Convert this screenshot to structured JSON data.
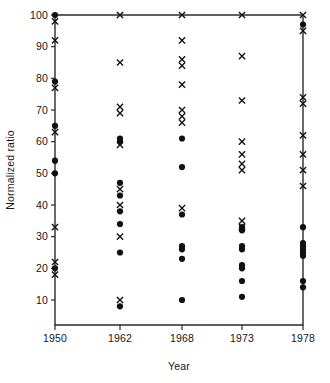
{
  "chart_data": {
    "type": "scatter",
    "title": "",
    "xlabel": "Year",
    "ylabel": "Normalized ratio",
    "grid": false,
    "legend": "none",
    "categories": [
      "1950",
      "1962",
      "1968",
      "1973",
      "1978"
    ],
    "xtick_labels": [
      "1950",
      "1962",
      "1968",
      "1973",
      "1978"
    ],
    "ytick_labels": [
      "10",
      "20",
      "30",
      "40",
      "50",
      "60",
      "70",
      "80",
      "90",
      "100"
    ],
    "ylim": [
      0,
      100
    ],
    "ytick_values": [
      10,
      20,
      30,
      40,
      50,
      60,
      70,
      80,
      90,
      100
    ],
    "marker_types": [
      "filled-circle",
      "cross"
    ],
    "series": [
      {
        "name": "filled-circle",
        "marker": "filled-circle",
        "points": [
          {
            "x": "1950",
            "y": 100
          },
          {
            "x": "1950",
            "y": 79
          },
          {
            "x": "1950",
            "y": 65
          },
          {
            "x": "1950",
            "y": 54
          },
          {
            "x": "1950",
            "y": 50
          },
          {
            "x": "1950",
            "y": 20
          },
          {
            "x": "1962",
            "y": 61
          },
          {
            "x": "1962",
            "y": 60
          },
          {
            "x": "1962",
            "y": 47
          },
          {
            "x": "1962",
            "y": 43
          },
          {
            "x": "1962",
            "y": 38
          },
          {
            "x": "1962",
            "y": 34
          },
          {
            "x": "1962",
            "y": 25
          },
          {
            "x": "1962",
            "y": 8
          },
          {
            "x": "1968",
            "y": 61
          },
          {
            "x": "1968",
            "y": 52
          },
          {
            "x": "1968",
            "y": 37
          },
          {
            "x": "1968",
            "y": 27
          },
          {
            "x": "1968",
            "y": 26
          },
          {
            "x": "1968",
            "y": 23
          },
          {
            "x": "1968",
            "y": 10
          },
          {
            "x": "1973",
            "y": 33
          },
          {
            "x": "1973",
            "y": 32
          },
          {
            "x": "1973",
            "y": 27
          },
          {
            "x": "1973",
            "y": 26
          },
          {
            "x": "1973",
            "y": 21
          },
          {
            "x": "1973",
            "y": 20
          },
          {
            "x": "1973",
            "y": 16
          },
          {
            "x": "1973",
            "y": 11
          },
          {
            "x": "1978",
            "y": 97
          },
          {
            "x": "1978",
            "y": 33
          },
          {
            "x": "1978",
            "y": 28
          },
          {
            "x": "1978",
            "y": 27
          },
          {
            "x": "1978",
            "y": 26
          },
          {
            "x": "1978",
            "y": 25
          },
          {
            "x": "1978",
            "y": 24
          },
          {
            "x": "1978",
            "y": 16
          },
          {
            "x": "1978",
            "y": 14
          }
        ]
      },
      {
        "name": "cross",
        "marker": "cross",
        "points": [
          {
            "x": "1950",
            "y": 98
          },
          {
            "x": "1950",
            "y": 92
          },
          {
            "x": "1950",
            "y": 77
          },
          {
            "x": "1950",
            "y": 63
          },
          {
            "x": "1950",
            "y": 33
          },
          {
            "x": "1950",
            "y": 22
          },
          {
            "x": "1950",
            "y": 18
          },
          {
            "x": "1962",
            "y": 100
          },
          {
            "x": "1962",
            "y": 85
          },
          {
            "x": "1962",
            "y": 71
          },
          {
            "x": "1962",
            "y": 69
          },
          {
            "x": "1962",
            "y": 59
          },
          {
            "x": "1962",
            "y": 45
          },
          {
            "x": "1962",
            "y": 40
          },
          {
            "x": "1962",
            "y": 30
          },
          {
            "x": "1962",
            "y": 10
          },
          {
            "x": "1968",
            "y": 100
          },
          {
            "x": "1968",
            "y": 92
          },
          {
            "x": "1968",
            "y": 86
          },
          {
            "x": "1968",
            "y": 84
          },
          {
            "x": "1968",
            "y": 78
          },
          {
            "x": "1968",
            "y": 70
          },
          {
            "x": "1968",
            "y": 68
          },
          {
            "x": "1968",
            "y": 66
          },
          {
            "x": "1968",
            "y": 39
          },
          {
            "x": "1973",
            "y": 100
          },
          {
            "x": "1973",
            "y": 87
          },
          {
            "x": "1973",
            "y": 73
          },
          {
            "x": "1973",
            "y": 60
          },
          {
            "x": "1973",
            "y": 56
          },
          {
            "x": "1973",
            "y": 53
          },
          {
            "x": "1973",
            "y": 51
          },
          {
            "x": "1973",
            "y": 35
          },
          {
            "x": "1973",
            "y": 33
          },
          {
            "x": "1978",
            "y": 100
          },
          {
            "x": "1978",
            "y": 95
          },
          {
            "x": "1978",
            "y": 74
          },
          {
            "x": "1978",
            "y": 72
          },
          {
            "x": "1978",
            "y": 62
          },
          {
            "x": "1978",
            "y": 56
          },
          {
            "x": "1978",
            "y": 51
          },
          {
            "x": "1978",
            "y": 46
          }
        ]
      }
    ]
  },
  "axes": {
    "y_title": "Normalized ratio",
    "x_title": "Year"
  }
}
